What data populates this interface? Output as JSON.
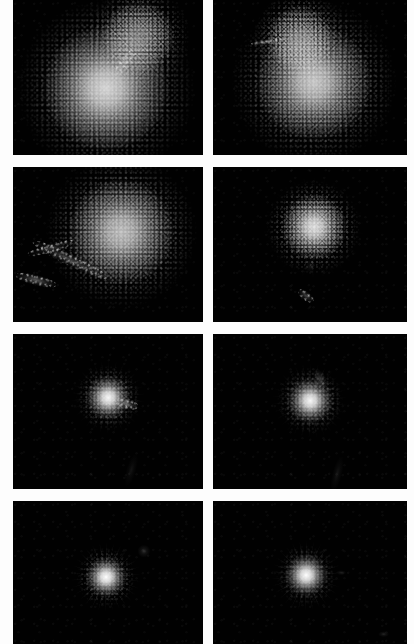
{
  "figure": {
    "background_color": "#fdfdfd",
    "panel_background_color": "#010101",
    "columns": 2,
    "rows": 4,
    "caption": "",
    "panels": [
      {
        "id": "panel-r1c1",
        "label": "",
        "row": 1,
        "column": 1,
        "x": 13,
        "y": 0,
        "width": 190,
        "height": 155,
        "description": "Two overlapping grainy lobes: large bright lower lobe with a smaller companion lobe above-right",
        "sources": [
          {
            "name": "primary-lobe",
            "cx": 49,
            "cy": 57,
            "r": 33,
            "core": 0.82,
            "grain": 0.7,
            "skirt": 0.6,
            "spikes": 0
          },
          {
            "name": "companion-lobe",
            "cx": 66,
            "cy": 24,
            "r": 19,
            "core": 0.42,
            "grain": 0.75,
            "skirt": 0.55,
            "spikes": 0
          }
        ],
        "streaks": [
          {
            "name": "bridge",
            "cx": 59,
            "cy": 40,
            "w": 16,
            "h": 7,
            "angle": -52,
            "s": 0.22,
            "speckled": true
          }
        ]
      },
      {
        "id": "panel-r1c2",
        "label": "",
        "row": 1,
        "column": 2,
        "x": 213,
        "y": 0,
        "width": 194,
        "height": 155,
        "description": "Merging pair: bright lower-right lobe with fainter upper lobe and a thin horizontal wisp to the left",
        "sources": [
          {
            "name": "primary-lobe",
            "cx": 52,
            "cy": 53,
            "r": 30,
            "core": 0.76,
            "grain": 0.7,
            "skirt": 0.58,
            "spikes": 0
          },
          {
            "name": "companion-lobe",
            "cx": 45,
            "cy": 25,
            "r": 17,
            "core": 0.38,
            "grain": 0.78,
            "skirt": 0.52,
            "spikes": 0
          }
        ],
        "streaks": [
          {
            "name": "west-wisp",
            "cx": 28,
            "cy": 27,
            "w": 17,
            "h": 4,
            "angle": -8,
            "s": 0.3,
            "speckled": true
          }
        ]
      },
      {
        "id": "panel-r2c1",
        "label": "",
        "row": 2,
        "column": 1,
        "x": 13,
        "y": 167,
        "width": 190,
        "height": 155,
        "description": "Single grainy blob upper-right of centre with a long faint tidal tail sweeping to the lower-left corner",
        "sources": [
          {
            "name": "primary-lobe",
            "cx": 57,
            "cy": 42,
            "r": 28,
            "core": 0.72,
            "grain": 0.72,
            "skirt": 0.62,
            "spikes": 0
          }
        ],
        "streaks": [
          {
            "name": "tidal-tail",
            "cx": 30,
            "cy": 60,
            "w": 44,
            "h": 8,
            "angle": 26,
            "s": 0.26,
            "speckled": true
          },
          {
            "name": "tail-knot",
            "cx": 12,
            "cy": 73,
            "w": 22,
            "h": 7,
            "angle": 14,
            "s": 0.34,
            "speckled": true
          },
          {
            "name": "tail-extension",
            "cx": 20,
            "cy": 52,
            "w": 26,
            "h": 6,
            "angle": -16,
            "s": 0.14,
            "speckled": true
          }
        ]
      },
      {
        "id": "panel-r2c2",
        "label": "",
        "row": 2,
        "column": 2,
        "x": 213,
        "y": 167,
        "width": 194,
        "height": 155,
        "description": "Compact bright blob above centre with a small faint knot directly below it",
        "sources": [
          {
            "name": "primary-lobe",
            "cx": 52,
            "cy": 39,
            "r": 17,
            "core": 0.86,
            "grain": 0.72,
            "skirt": 0.55,
            "spikes": 0.18
          }
        ],
        "streaks": [
          {
            "name": "southern-knot",
            "cx": 48,
            "cy": 83,
            "w": 10,
            "h": 6,
            "angle": 38,
            "s": 0.26,
            "speckled": true
          },
          {
            "name": "connecting-wisp",
            "cx": 50,
            "cy": 64,
            "w": 5,
            "h": 9,
            "angle": 8,
            "s": 0.09,
            "speckled": false
          }
        ]
      },
      {
        "id": "panel-r3c1",
        "label": "",
        "row": 3,
        "column": 1,
        "x": 13,
        "y": 334,
        "width": 190,
        "height": 155,
        "description": "Small very bright core just above centre with a faint plume extending to the right",
        "sources": [
          {
            "name": "primary-core",
            "cx": 50,
            "cy": 41,
            "r": 12,
            "core": 0.97,
            "grain": 0.5,
            "skirt": 0.5,
            "spikes": 0.3
          }
        ],
        "streaks": [
          {
            "name": "east-plume",
            "cx": 60,
            "cy": 45,
            "w": 12,
            "h": 7,
            "angle": 14,
            "s": 0.34,
            "speckled": true
          },
          {
            "name": "south-streak",
            "cx": 62,
            "cy": 88,
            "w": 5,
            "h": 22,
            "angle": 16,
            "s": 0.07,
            "speckled": false
          }
        ]
      },
      {
        "id": "panel-r3c2",
        "label": "",
        "row": 3,
        "column": 2,
        "x": 213,
        "y": 334,
        "width": 194,
        "height": 155,
        "description": "Small very bright core just above centre with a thin filament curving up to the right",
        "sources": [
          {
            "name": "primary-core",
            "cx": 50,
            "cy": 43,
            "r": 12,
            "core": 0.97,
            "grain": 0.5,
            "skirt": 0.48,
            "spikes": 0.3
          }
        ],
        "streaks": [
          {
            "name": "north-filament",
            "cx": 55,
            "cy": 29,
            "w": 6,
            "h": 14,
            "angle": -28,
            "s": 0.22,
            "speckled": false
          },
          {
            "name": "south-streak",
            "cx": 64,
            "cy": 90,
            "w": 5,
            "h": 24,
            "angle": 14,
            "s": 0.08,
            "speckled": false
          }
        ]
      },
      {
        "id": "panel-r4c1",
        "label": "",
        "row": 4,
        "column": 1,
        "x": 13,
        "y": 501,
        "width": 190,
        "height": 143,
        "description": "Single compact bright unresolved source near the centre with radial diffraction spikes",
        "sources": [
          {
            "name": "primary-core",
            "cx": 49,
            "cy": 53,
            "r": 11,
            "core": 1.0,
            "grain": 0.4,
            "skirt": 0.4,
            "spikes": 0.4
          }
        ],
        "streaks": [
          {
            "name": "ne-wisp",
            "cx": 69,
            "cy": 35,
            "w": 7,
            "h": 9,
            "angle": -36,
            "s": 0.16,
            "speckled": false
          }
        ]
      },
      {
        "id": "panel-r4c2",
        "label": "",
        "row": 4,
        "column": 2,
        "x": 213,
        "y": 501,
        "width": 194,
        "height": 143,
        "description": "Single compact bright unresolved source near the centre with radial diffraction spikes",
        "sources": [
          {
            "name": "primary-core",
            "cx": 48,
            "cy": 52,
            "r": 11,
            "core": 1.0,
            "grain": 0.4,
            "skirt": 0.4,
            "spikes": 0.4
          }
        ],
        "streaks": [
          {
            "name": "east-speck",
            "cx": 66,
            "cy": 50,
            "w": 5,
            "h": 4,
            "angle": 0,
            "s": 0.12,
            "speckled": false
          },
          {
            "name": "corner-speck",
            "cx": 88,
            "cy": 93,
            "w": 6,
            "h": 4,
            "angle": 0,
            "s": 0.14,
            "speckled": false
          }
        ]
      }
    ]
  }
}
